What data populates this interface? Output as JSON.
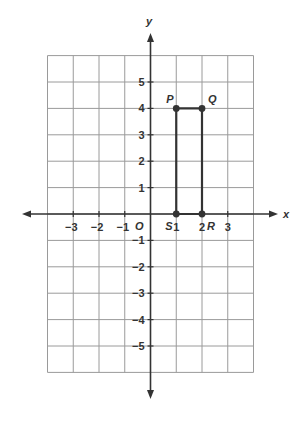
{
  "diagram": {
    "type": "coordinate-plane",
    "axes": {
      "x_label": "x",
      "y_label": "y",
      "origin_label": "O"
    },
    "grid": {
      "x_min": -4,
      "x_max": 4,
      "y_min": -6,
      "y_max": 6
    },
    "x_ticks": [
      {
        "value": -3,
        "label": "−3"
      },
      {
        "value": -2,
        "label": "−2"
      },
      {
        "value": -1,
        "label": "−1"
      },
      {
        "value": 1,
        "label": "1"
      },
      {
        "value": 2,
        "label": "2"
      },
      {
        "value": 3,
        "label": "3"
      }
    ],
    "y_ticks": [
      {
        "value": 5,
        "label": "5"
      },
      {
        "value": 4,
        "label": "4"
      },
      {
        "value": 3,
        "label": "3"
      },
      {
        "value": 2,
        "label": "2"
      },
      {
        "value": 1,
        "label": "1"
      },
      {
        "value": -1,
        "label": "−1"
      },
      {
        "value": -2,
        "label": "−2"
      },
      {
        "value": -3,
        "label": "−3"
      },
      {
        "value": -4,
        "label": "−4"
      },
      {
        "value": -5,
        "label": "−5"
      }
    ],
    "points": [
      {
        "name": "P",
        "x": 1,
        "y": 4
      },
      {
        "name": "Q",
        "x": 2,
        "y": 4
      },
      {
        "name": "R",
        "x": 2,
        "y": 0
      },
      {
        "name": "S",
        "x": 1,
        "y": 0
      }
    ],
    "polygon": [
      "P",
      "Q",
      "R",
      "S"
    ],
    "colors": {
      "grid": "#9a9a9a",
      "axis": "#333333",
      "shape": "#333333",
      "label": "#333333"
    }
  }
}
